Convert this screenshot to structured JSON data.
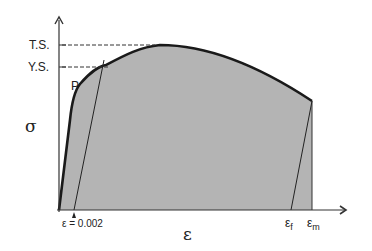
{
  "diagram": {
    "y_axis_symbol": "σ",
    "x_axis_symbol": "ε",
    "y_labels": {
      "tensile_strength": "T.S.",
      "yield_strength": "Y.S."
    },
    "point_label": "P",
    "offset_label": "ε = 0.002",
    "strain_labels": {
      "fracture": "ε",
      "fracture_sub": "f",
      "max": "ε",
      "max_sub": "m"
    },
    "colors": {
      "fill": "#b4b4b4",
      "curve": "#1a1a1a",
      "axis": "#333333",
      "background": "#ffffff"
    }
  }
}
